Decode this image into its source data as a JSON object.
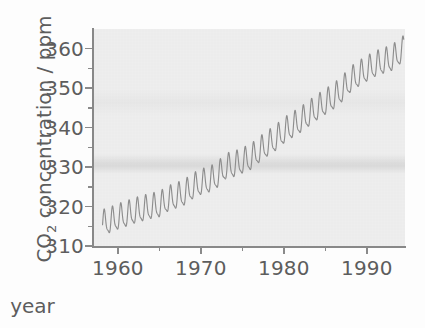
{
  "chart_data": {
    "type": "line",
    "title": "",
    "xlabel": "year",
    "ylabel": "CO2 concentration / ppm",
    "ylabel_display": "CO",
    "ylabel_sub": "2",
    "ylabel_rest": " concentration / ppm",
    "xlim": [
      1957.0,
      1994.6
    ],
    "ylim": [
      310,
      365
    ],
    "xticks": [
      1960,
      1970,
      1980,
      1990
    ],
    "xticklabels": [
      "1960",
      "1970",
      "1980",
      "1990"
    ],
    "xminorticks": [
      1965,
      1975,
      1985
    ],
    "yticks": [
      310,
      320,
      330,
      340,
      350,
      360
    ],
    "yticklabels": [
      "310",
      "320",
      "330",
      "340",
      "350",
      "360"
    ],
    "grid": false,
    "legend": "none",
    "series": [
      {
        "name": "Mauna Loa monthly mean CO2",
        "description": "Keeling curve: monthly atmospheric CO2 concentration showing a rising trend with an annual seasonal oscillation of about 6 ppm peak-to-peak.",
        "annual_trend": {
          "x": [
            1958,
            1959,
            1960,
            1961,
            1962,
            1963,
            1964,
            1965,
            1966,
            1967,
            1968,
            1969,
            1970,
            1971,
            1972,
            1973,
            1974,
            1975,
            1976,
            1977,
            1978,
            1979,
            1980,
            1981,
            1982,
            1983,
            1984,
            1985,
            1986,
            1987,
            1988,
            1989,
            1990,
            1991,
            1992,
            1993,
            1994
          ],
          "y": [
            315.3,
            316.0,
            316.9,
            317.6,
            318.4,
            319.0,
            319.6,
            320.0,
            321.4,
            322.2,
            323.0,
            324.6,
            325.7,
            326.3,
            327.5,
            329.7,
            330.2,
            331.1,
            332.0,
            333.8,
            335.4,
            336.8,
            338.7,
            340.1,
            341.4,
            343.0,
            344.6,
            346.0,
            347.4,
            349.2,
            351.6,
            353.1,
            354.4,
            355.6,
            356.4,
            357.1,
            358.8
          ]
        },
        "seasonal_amplitude_ppm": 6.0,
        "seasonal_peak_month": "May",
        "seasonal_trough_month": "September",
        "start_value_ppm": 315.3,
        "end_value_ppm": 358.8,
        "color": "#8d8d8d"
      }
    ],
    "panel_color": "#f0f0f0",
    "axis_color": "#8a8a8a",
    "text_color": "#5d5d5d"
  },
  "axes": {
    "y_ticks": [
      {
        "label": "360",
        "value": 360
      },
      {
        "label": "350",
        "value": 350
      },
      {
        "label": "340",
        "value": 340
      },
      {
        "label": "330",
        "value": 330
      },
      {
        "label": "320",
        "value": 320
      },
      {
        "label": "310",
        "value": 310
      }
    ],
    "x_ticks": [
      {
        "label": "1960",
        "value": 1960
      },
      {
        "label": "1970",
        "value": 1970
      },
      {
        "label": "1980",
        "value": 1980
      },
      {
        "label": "1990",
        "value": 1990
      }
    ],
    "x_axis_label": "year",
    "y_axis_label_main": "CO",
    "y_axis_label_sub": "2",
    "y_axis_label_tail": " concentration / ppm"
  }
}
